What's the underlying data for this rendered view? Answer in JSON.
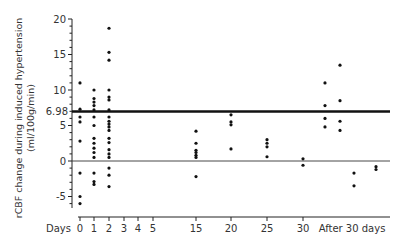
{
  "chart_data": {
    "type": "scatter",
    "title": "",
    "ylabel": "rCBF change during induced hypertension",
    "ylabel_unit": "(ml/100g/min)",
    "xlabel": "Days",
    "ylim": [
      -6.6,
      20
    ],
    "yticks": [
      -5,
      0,
      5,
      10,
      15,
      20
    ],
    "reference_lines": [
      {
        "y": 6.98,
        "label": "6.98",
        "style": "thick"
      },
      {
        "y": 0,
        "label": "",
        "style": "thin"
      }
    ],
    "x_tick_labels": [
      "0",
      "1",
      "2",
      "3",
      "4",
      "5",
      "15",
      "20",
      "25",
      "30",
      "After 30 days"
    ],
    "grid": false,
    "legend": null,
    "series": [
      {
        "x": "0",
        "values": [
          11,
          7.3,
          6.2,
          5.5,
          2.8,
          -1.7,
          -5,
          -6
        ]
      },
      {
        "x": "1",
        "values": [
          10,
          8.8,
          8.3,
          7.8,
          7.2,
          6.2,
          5,
          3.2,
          2.5,
          1.8,
          1.2,
          0.5,
          -1.7,
          -2.9,
          -3.3
        ]
      },
      {
        "x": "2",
        "values": [
          18.7,
          15.3,
          14.2,
          10,
          9,
          8.6,
          7.2,
          6.2,
          5.6,
          5.2,
          4.8,
          4.3,
          3.2,
          2.6,
          1.6,
          1,
          0.5,
          -1,
          -2,
          -3.6
        ]
      },
      {
        "x": "15",
        "values": [
          4.2,
          2.5,
          1.5,
          1.2,
          0.8,
          0.5,
          -2.2
        ]
      },
      {
        "x": "20",
        "values": [
          6.5,
          5.5,
          5.1,
          1.7
        ]
      },
      {
        "x": "25",
        "values": [
          3,
          2.5,
          2,
          0.6
        ]
      },
      {
        "x": "30",
        "values": [
          0.3,
          -0.6
        ]
      },
      {
        "x": "After 30 days (a)",
        "values": [
          11,
          7.8,
          6,
          4.8
        ]
      },
      {
        "x": "After 30 days (b)",
        "values": [
          13.5,
          8.5,
          5.6,
          4.3
        ]
      },
      {
        "x": "After 30 days (c)",
        "values": [
          -1.7,
          -3.5
        ]
      },
      {
        "x": "After 30 days (d)",
        "values": [
          -0.8,
          -1.2
        ]
      }
    ]
  },
  "labels": {
    "days": "Days",
    "ref": "6.98",
    "ylabel1": "rCBF change during induced hypertension",
    "ylabel2": "(ml/100g/min)"
  }
}
